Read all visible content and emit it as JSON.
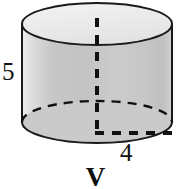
{
  "figure": {
    "shape_name": "cylinder",
    "caption": "V",
    "labels": {
      "height_label": "5",
      "radius_label": "4"
    },
    "colors": {
      "body_fill": "#c9c9c9",
      "body_fill_light": "#e2e2e2",
      "top_face_fill": "#ededed",
      "outline": "#1a1a1a",
      "dashed_line": "#111111",
      "background": "#ffffff",
      "text": "#111111"
    },
    "geometry": {
      "left_x": 22,
      "right_x": 172,
      "top_ellipse_center_y": 24,
      "bottom_ellipse_center_y": 122,
      "ellipse_radius_x": 75,
      "ellipse_radius_y": 21
    },
    "elements": {
      "top_ellipse_name": "cylinder-top-face",
      "body_name": "cylinder-lateral-surface",
      "bottom_front_arc_name": "cylinder-bottom-front-arc",
      "bottom_back_arc_name": "cylinder-bottom-back-arc-dashed",
      "axis_name": "cylinder-height-axis-dashed",
      "radius_name": "cylinder-radius-dashed"
    }
  }
}
